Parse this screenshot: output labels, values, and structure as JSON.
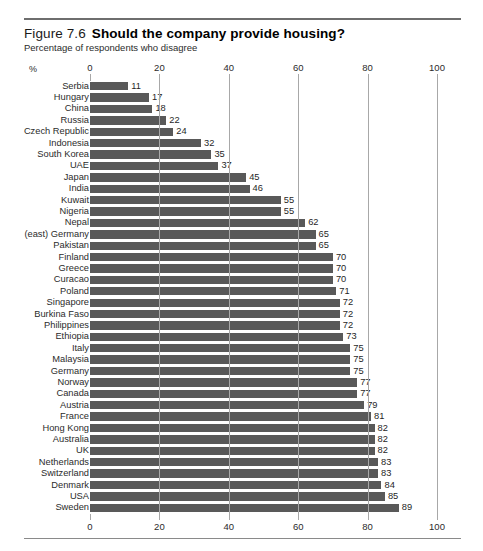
{
  "figure": {
    "number": "Figure 7.6",
    "title": "Should the company provide housing?",
    "subtitle": "Percentage of respondents who disagree",
    "unit_label": "%"
  },
  "colors": {
    "bar": "#595959",
    "gridline": "#a8a8a8",
    "rule": "#6e6e6e",
    "text": "#2b2b2b"
  },
  "chart_data": {
    "type": "bar",
    "orientation": "horizontal",
    "title": "Should the company provide housing?",
    "subtitle": "Percentage of respondents who disagree",
    "xlabel": "%",
    "ylabel": "",
    "xlim": [
      0,
      100
    ],
    "xticks": [
      0,
      20,
      40,
      60,
      80,
      100
    ],
    "grid": true,
    "axis_position": "both",
    "legend": "none",
    "data_labels": true,
    "categories": [
      "Serbia",
      "Hungary",
      "China",
      "Russia",
      "Czech Republic",
      "Indonesia",
      "South Korea",
      "UAE",
      "Japan",
      "India",
      "Kuwait",
      "Nigeria",
      "Nepal",
      "(east) Germany",
      "Pakistan",
      "Finland",
      "Greece",
      "Curacao",
      "Poland",
      "Singapore",
      "Burkina Faso",
      "Philippines",
      "Ethiopia",
      "Italy",
      "Malaysia",
      "Germany",
      "Norway",
      "Canada",
      "Austria",
      "France",
      "Hong Kong",
      "Australia",
      "UK",
      "Netherlands",
      "Switzerland",
      "Denmark",
      "USA",
      "Sweden"
    ],
    "values": [
      11,
      17,
      18,
      22,
      24,
      32,
      35,
      37,
      45,
      46,
      55,
      55,
      62,
      65,
      65,
      70,
      70,
      70,
      71,
      72,
      72,
      72,
      73,
      75,
      75,
      75,
      77,
      77,
      79,
      81,
      82,
      82,
      82,
      83,
      83,
      84,
      85,
      89
    ]
  }
}
